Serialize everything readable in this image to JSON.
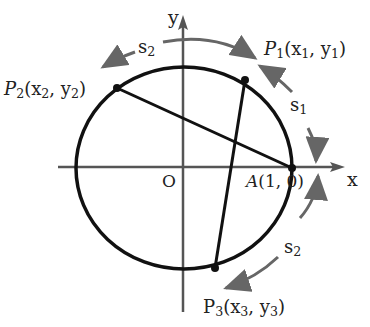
{
  "diagram": {
    "type": "unit-circle-arc-length",
    "axes": {
      "x_label": "x",
      "y_label": "y",
      "origin_label": "O"
    },
    "points": {
      "A": {
        "label": "A(1, 0)",
        "name": "A",
        "coords": "(1, 0)"
      },
      "P1": {
        "name": "P",
        "sub": "1",
        "coords_x": "x",
        "coords_xsub": "1",
        "coords_y": "y",
        "coords_ysub": "1"
      },
      "P2": {
        "name": "P",
        "sub": "2",
        "coords_x": "x",
        "coords_xsub": "2",
        "coords_y": "y",
        "coords_ysub": "2"
      },
      "P3": {
        "name": "P",
        "sub": "3",
        "coords_x": "x",
        "coords_xsub": "3",
        "coords_y": "y",
        "coords_ysub": "3"
      }
    },
    "arcs": {
      "s1": {
        "name": "s",
        "sub": "1"
      },
      "s2_top": {
        "name": "s",
        "sub": "2"
      },
      "s2_bottom": {
        "name": "s",
        "sub": "2"
      }
    },
    "colors": {
      "circle": "#111111",
      "axes": "#555555",
      "arrows": "#666666"
    }
  }
}
